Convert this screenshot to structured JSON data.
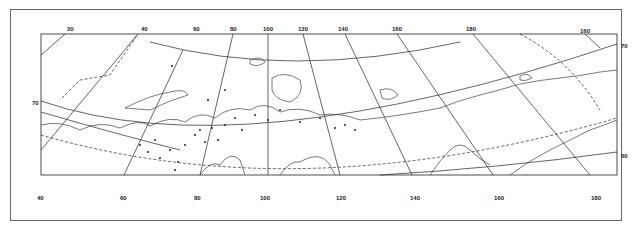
{
  "map": {
    "title": "",
    "top_longitude_labels": [
      "20",
      "40",
      "60",
      "80",
      "100",
      "120",
      "140",
      "160",
      "180",
      "160"
    ],
    "bottom_longitude_labels": [
      "40",
      "60",
      "80",
      "100",
      "120",
      "140",
      "160",
      "180"
    ],
    "left_latitude_labels": [
      "70"
    ],
    "right_latitude_labels": [
      "70",
      "60"
    ],
    "colors": {
      "line": "#222222",
      "background": "#ffffff",
      "border": "#666666"
    }
  }
}
